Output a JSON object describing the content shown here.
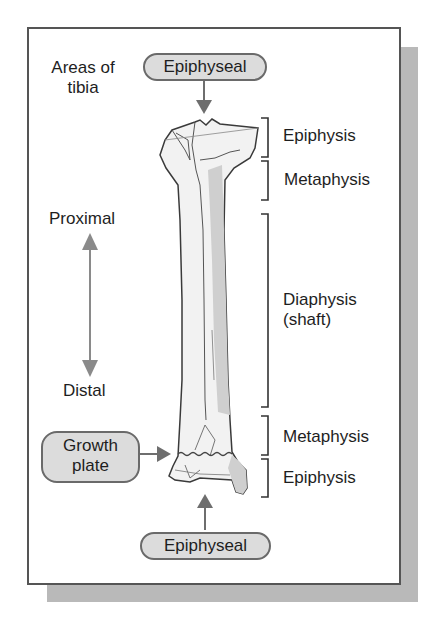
{
  "diagram": {
    "title_line1": "Areas of",
    "title_line2": "tibia",
    "top_label": "Epiphyseal",
    "bottom_label": "Epiphyseal",
    "growth_plate_line1": "Growth",
    "growth_plate_line2": "plate",
    "direction": {
      "proximal": "Proximal",
      "distal": "Distal"
    },
    "regions": [
      {
        "label": "Epiphysis"
      },
      {
        "label": "Metaphysis"
      },
      {
        "label_line1": "Diaphysis",
        "label_line2": "(shaft)"
      },
      {
        "label": "Metaphysis"
      },
      {
        "label": "Epiphysis"
      }
    ],
    "colors": {
      "pill_fill": "#dcdcdc",
      "arrow": "#6e6e6e",
      "bone_fill": "#f2f2f2",
      "bone_shade": "#c8c8c8",
      "frame_shadow": "#b9b9b9"
    }
  }
}
